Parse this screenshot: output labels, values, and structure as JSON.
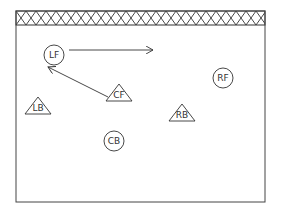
{
  "diagram": {
    "type": "field-formation",
    "field": {
      "x": 16,
      "y": 11,
      "width": 249,
      "height": 191,
      "hatch_band_height": 14
    },
    "players": [
      {
        "id": "LF",
        "label": "LF",
        "shape": "circle",
        "x": 54,
        "y": 55,
        "r": 10
      },
      {
        "id": "RF",
        "label": "RF",
        "shape": "circle",
        "x": 223,
        "y": 78,
        "r": 10
      },
      {
        "id": "CB",
        "label": "CB",
        "shape": "circle",
        "x": 114,
        "y": 141,
        "r": 10
      },
      {
        "id": "CF",
        "label": "CF",
        "shape": "triangle",
        "x": 119,
        "y": 93
      },
      {
        "id": "LB",
        "label": "LB",
        "shape": "triangle",
        "x": 38,
        "y": 106
      },
      {
        "id": "RB",
        "label": "RB",
        "shape": "triangle",
        "x": 182,
        "y": 113
      }
    ],
    "arrows": [
      {
        "from": "LF",
        "x1": 69,
        "y1": 50,
        "x2": 153,
        "y2": 50
      },
      {
        "from": "CF",
        "x1": 108,
        "y1": 97,
        "x2": 48,
        "y2": 67
      }
    ],
    "colors": {
      "stroke": "#333333",
      "background": "#ffffff"
    }
  }
}
